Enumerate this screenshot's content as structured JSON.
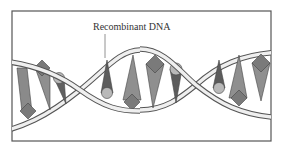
{
  "diagram": {
    "label": "Recombinant DNA",
    "colors": {
      "frame": "#555555",
      "strand_fill": "#efefef",
      "strand_stroke": "#555555",
      "base_light": "#9a9a9a",
      "base_mid": "#7d7d7d",
      "base_dark": "#5c5c5c",
      "sphere": "#b9b9b9",
      "pointer": "#777777"
    },
    "bases": [
      {
        "type": "cone-diamond",
        "position": "left-1"
      },
      {
        "type": "diamond-cone",
        "position": "left-2"
      },
      {
        "type": "sphere-cone",
        "position": "left-3"
      },
      {
        "type": "cone-sphere",
        "position": "center-1"
      },
      {
        "type": "cone-diamond",
        "position": "center-2"
      },
      {
        "type": "diamond-cone",
        "position": "center-3"
      },
      {
        "type": "sphere-cone",
        "position": "center-4"
      },
      {
        "type": "cone-sphere",
        "position": "right-1"
      },
      {
        "type": "cone-diamond",
        "position": "right-2"
      },
      {
        "type": "diamond-cone",
        "position": "right-3"
      }
    ]
  }
}
